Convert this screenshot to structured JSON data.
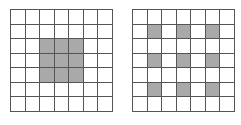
{
  "colors": {
    "line": "#555555",
    "filled": "#a9a9a9",
    "empty": "#ffffff"
  },
  "grids": [
    {
      "name": "grid-left",
      "rows": 7,
      "cols": 7,
      "filled": [
        [
          2,
          2
        ],
        [
          2,
          3
        ],
        [
          2,
          4
        ],
        [
          3,
          2
        ],
        [
          3,
          3
        ],
        [
          3,
          4
        ],
        [
          4,
          2
        ],
        [
          4,
          3
        ],
        [
          4,
          4
        ]
      ]
    },
    {
      "name": "grid-right",
      "rows": 7,
      "cols": 7,
      "filled": [
        [
          1,
          1
        ],
        [
          1,
          3
        ],
        [
          1,
          5
        ],
        [
          3,
          1
        ],
        [
          3,
          3
        ],
        [
          3,
          5
        ],
        [
          5,
          1
        ],
        [
          5,
          3
        ],
        [
          5,
          5
        ]
      ]
    }
  ]
}
